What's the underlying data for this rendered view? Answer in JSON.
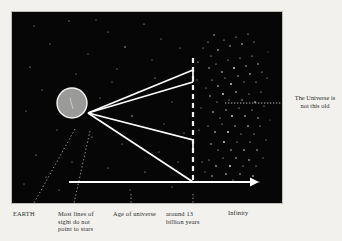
{
  "figure": {
    "panel": {
      "background_color": "#060606",
      "border_color": "#bdbcb8"
    },
    "colors": {
      "background": "#f2f1ee",
      "sky": "#060606",
      "ray": "#ffffff",
      "earth_fill": "#9a9a98",
      "earth_stroke": "#f4f4f2",
      "star": "#e8e8e6",
      "text": "#2c2c2c",
      "leader": "#b9b8b3"
    }
  },
  "diagram": {
    "earth": {
      "name": "earth-disc",
      "cx": 71,
      "cy": 102,
      "r": 15
    },
    "vertex": {
      "x": 87,
      "y": 101
    },
    "rays": [
      {
        "name": "line-of-sight-1",
        "x1": 87,
        "y1": 101,
        "x2": 192,
        "y2": 59,
        "step_to_y": 59
      },
      {
        "name": "line-of-sight-2",
        "x1": 87,
        "y1": 101,
        "x2": 185,
        "y2": 81,
        "step_to_y": 70
      },
      {
        "name": "line-of-sight-3",
        "x1": 87,
        "y1": 101,
        "x2": 185,
        "y2": 129,
        "step_to_y": 140
      },
      {
        "name": "line-of-sight-4",
        "x1": 87,
        "y1": 101,
        "x2": 192,
        "y2": 180,
        "step_to_y": 180
      }
    ],
    "age_boundary": {
      "name": "age-of-universe-boundary",
      "x": 192,
      "y_top": 57,
      "y_bottom": 181,
      "style": "dashed"
    },
    "time_arrow": {
      "name": "time-axis-arrow",
      "x1": 68,
      "y1": 181,
      "x2": 253,
      "y2": 181,
      "direction": "right"
    },
    "star_field": {
      "name": "distant-star-field",
      "dense_region_x": [
        194,
        252
      ],
      "dense_region_y": [
        55,
        180
      ]
    },
    "pointer_to_caption": {
      "name": "caption-leader-line",
      "x1": 224,
      "y1": 102,
      "x2": 281,
      "y2": 102
    }
  },
  "labels": {
    "earth": "EARTH",
    "lines_of_sight": "Most lines of\nsight do not\npoint to stars",
    "age_of_universe": "Age of universe",
    "around_13_billion": "around 13\nbillion years",
    "infinity": "Infinity"
  },
  "caption": {
    "universe_not_this_old": "The Universe is\nnot this old"
  }
}
